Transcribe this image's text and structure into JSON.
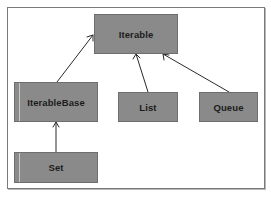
{
  "diagram": {
    "type": "class-hierarchy",
    "colors": {
      "node_fill": "#8a8a8a",
      "node_border": "#6e6e6e",
      "node_text": "#1c1c1c",
      "edge": "#2a2a2a",
      "frame": "#7a7a7a"
    },
    "nodes": [
      {
        "id": "iterable",
        "label": "Iterable"
      },
      {
        "id": "iterablebase",
        "label": "IterableBase"
      },
      {
        "id": "list",
        "label": "List"
      },
      {
        "id": "queue",
        "label": "Queue"
      },
      {
        "id": "set",
        "label": "Set"
      }
    ],
    "edges": [
      {
        "from": "IterableBase",
        "to": "Iterable",
        "style": "open-arrow"
      },
      {
        "from": "List",
        "to": "Iterable",
        "style": "open-arrow"
      },
      {
        "from": "Queue",
        "to": "Iterable",
        "style": "open-arrow"
      },
      {
        "from": "Set",
        "to": "IterableBase",
        "style": "open-arrow"
      }
    ]
  }
}
